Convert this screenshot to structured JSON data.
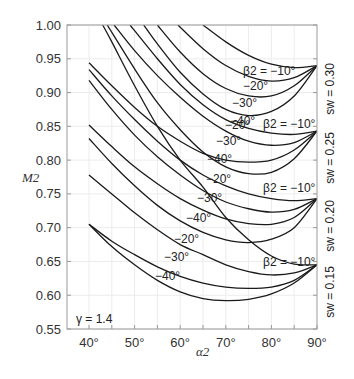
{
  "chart_data": {
    "type": "line",
    "title": "",
    "xlabel": "α2",
    "ylabel": "M2",
    "xlim": [
      35,
      90
    ],
    "ylim": [
      0.55,
      1.0
    ],
    "grid": true,
    "x_ticks": [
      "40°",
      "50°",
      "60°",
      "70°",
      "80°",
      "90°"
    ],
    "x_tick_values": [
      40,
      50,
      60,
      70,
      80,
      90
    ],
    "y_ticks": [
      "1.00",
      "0.95",
      "0.90",
      "0.85",
      "0.80",
      "0.75",
      "0.70",
      "0.65",
      "0.60",
      "0.55"
    ],
    "y_tick_values": [
      1.0,
      0.95,
      0.9,
      0.85,
      0.8,
      0.75,
      0.7,
      0.65,
      0.6,
      0.55
    ],
    "annotation_gamma": "γ = 1.4",
    "families": [
      {
        "name": "s_w = 0.30",
        "label": "sw = 0.30",
        "converge": [
          90,
          0.94
        ],
        "series": [
          {
            "name": "β2 = −10°",
            "points": [
              [
                65,
                1.0
              ],
              [
                70,
                0.975
              ],
              [
                75,
                0.955
              ],
              [
                80,
                0.942
              ],
              [
                85,
                0.937
              ],
              [
                90,
                0.94
              ]
            ]
          },
          {
            "name": "−20°",
            "points": [
              [
                59.5,
                1.0
              ],
              [
                65,
                0.965
              ],
              [
                70,
                0.94
              ],
              [
                75,
                0.924
              ],
              [
                80,
                0.917
              ],
              [
                85,
                0.922
              ],
              [
                90,
                0.94
              ]
            ]
          },
          {
            "name": "−30°",
            "points": [
              [
                55,
                1.0
              ],
              [
                60,
                0.96
              ],
              [
                65,
                0.928
              ],
              [
                70,
                0.906
              ],
              [
                75,
                0.895
              ],
              [
                80,
                0.895
              ],
              [
                85,
                0.91
              ],
              [
                90,
                0.94
              ]
            ]
          },
          {
            "name": "−40°",
            "points": [
              [
                52,
                1.0
              ],
              [
                55,
                0.972
              ],
              [
                60,
                0.93
              ],
              [
                65,
                0.898
              ],
              [
                70,
                0.875
              ],
              [
                75,
                0.866
              ],
              [
                80,
                0.872
              ],
              [
                85,
                0.895
              ],
              [
                90,
                0.94
              ]
            ]
          }
        ]
      },
      {
        "name": "s_w = 0.25",
        "label": "sw = 0.25",
        "converge": [
          90,
          0.843
        ],
        "series": [
          {
            "name": "β2 = −10°",
            "points": [
              [
                49,
                1.0
              ],
              [
                55,
                0.95
              ],
              [
                60,
                0.912
              ],
              [
                65,
                0.882
              ],
              [
                70,
                0.86
              ],
              [
                75,
                0.847
              ],
              [
                80,
                0.84
              ],
              [
                85,
                0.838
              ],
              [
                90,
                0.843
              ]
            ]
          },
          {
            "name": "−20°",
            "points": [
              [
                45.5,
                1.0
              ],
              [
                50,
                0.962
              ],
              [
                55,
                0.925
              ],
              [
                60,
                0.893
              ],
              [
                65,
                0.865
              ],
              [
                70,
                0.843
              ],
              [
                75,
                0.828
              ],
              [
                80,
                0.822
              ],
              [
                85,
                0.826
              ],
              [
                90,
                0.843
              ]
            ]
          },
          {
            "name": "−30°",
            "points": [
              [
                40,
                0.944
              ],
              [
                45,
                0.91
              ],
              [
                50,
                0.878
              ],
              [
                55,
                0.85
              ],
              [
                60,
                0.828
              ],
              [
                65,
                0.81
              ],
              [
                70,
                0.8
              ],
              [
                75,
                0.797
              ],
              [
                80,
                0.8
              ],
              [
                85,
                0.815
              ],
              [
                90,
                0.843
              ]
            ]
          },
          {
            "name": "−40°",
            "points": [
              [
                44,
                1.0
              ],
              [
                50,
                0.935
              ],
              [
                55,
                0.885
              ],
              [
                60,
                0.845
              ],
              [
                65,
                0.812
              ],
              [
                70,
                0.79
              ],
              [
                75,
                0.78
              ],
              [
                80,
                0.782
              ],
              [
                85,
                0.802
              ],
              [
                90,
                0.843
              ]
            ]
          }
        ]
      },
      {
        "name": "s_w = 0.20",
        "label": "sw = 0.20",
        "converge": [
          90,
          0.743
        ],
        "series": [
          {
            "name": "β2 = −10°",
            "points": [
              [
                40,
                0.934
              ],
              [
                45,
                0.895
              ],
              [
                50,
                0.86
              ],
              [
                55,
                0.828
              ],
              [
                60,
                0.8
              ],
              [
                65,
                0.778
              ],
              [
                70,
                0.762
              ],
              [
                75,
                0.75
              ],
              [
                80,
                0.743
              ],
              [
                85,
                0.74
              ],
              [
                90,
                0.743
              ]
            ]
          },
          {
            "name": "−20°",
            "points": [
              [
                40,
                0.918
              ],
              [
                45,
                0.875
              ],
              [
                50,
                0.837
              ],
              [
                55,
                0.805
              ],
              [
                60,
                0.778
              ],
              [
                65,
                0.755
              ],
              [
                70,
                0.738
              ],
              [
                75,
                0.728
              ],
              [
                80,
                0.723
              ],
              [
                85,
                0.727
              ],
              [
                90,
                0.743
              ]
            ]
          },
          {
            "name": "−30°",
            "points": [
              [
                40,
                0.852
              ],
              [
                45,
                0.82
              ],
              [
                50,
                0.79
              ],
              [
                55,
                0.765
              ],
              [
                60,
                0.743
              ],
              [
                65,
                0.726
              ],
              [
                70,
                0.713
              ],
              [
                75,
                0.706
              ],
              [
                80,
                0.705
              ],
              [
                85,
                0.715
              ],
              [
                90,
                0.743
              ]
            ]
          },
          {
            "name": "−40°",
            "points": [
              [
                40,
                0.832
              ],
              [
                45,
                0.795
              ],
              [
                50,
                0.762
              ],
              [
                55,
                0.733
              ],
              [
                60,
                0.71
              ],
              [
                65,
                0.693
              ],
              [
                70,
                0.682
              ],
              [
                75,
                0.678
              ],
              [
                80,
                0.683
              ],
              [
                85,
                0.7
              ],
              [
                90,
                0.743
              ]
            ]
          }
        ]
      },
      {
        "name": "s_w = 0.15",
        "label": "sw = 0.15",
        "converge": [
          90,
          0.645
        ],
        "series": [
          {
            "name": "β2 = −10°",
            "points": [
              [
                43,
                1.0
              ],
              [
                45,
                0.975
              ],
              [
                50,
                0.91
              ],
              [
                55,
                0.85
              ],
              [
                60,
                0.8
              ],
              [
                65,
                0.76
              ],
              [
                70,
                0.715
              ],
              [
                75,
                0.682
              ],
              [
                80,
                0.658
              ],
              [
                85,
                0.646
              ],
              [
                90,
                0.645
              ]
            ]
          },
          {
            "name": "−20°",
            "points": [
              [
                40,
                0.778
              ],
              [
                45,
                0.75
              ],
              [
                50,
                0.722
              ],
              [
                55,
                0.697
              ],
              [
                60,
                0.675
              ],
              [
                65,
                0.66
              ],
              [
                70,
                0.645
              ],
              [
                75,
                0.635
              ],
              [
                80,
                0.63
              ],
              [
                85,
                0.633
              ],
              [
                90,
                0.645
              ]
            ]
          },
          {
            "name": "−30°",
            "points": [
              [
                40,
                0.705
              ],
              [
                45,
                0.68
              ],
              [
                50,
                0.66
              ],
              [
                55,
                0.642
              ],
              [
                60,
                0.628
              ],
              [
                65,
                0.618
              ],
              [
                70,
                0.612
              ],
              [
                75,
                0.61
              ],
              [
                80,
                0.612
              ],
              [
                85,
                0.622
              ],
              [
                90,
                0.645
              ]
            ]
          },
          {
            "name": "−40°",
            "points": [
              [
                40,
                0.705
              ],
              [
                45,
                0.672
              ],
              [
                50,
                0.645
              ],
              [
                55,
                0.622
              ],
              [
                60,
                0.605
              ],
              [
                65,
                0.595
              ],
              [
                70,
                0.592
              ],
              [
                75,
                0.594
              ],
              [
                80,
                0.602
              ],
              [
                85,
                0.618
              ],
              [
                90,
                0.645
              ]
            ]
          }
        ]
      }
    ],
    "curve_labels": [
      {
        "text": "β2 = −10°",
        "x": 243,
        "y": 75
      },
      {
        "text": "−20°",
        "x": 243,
        "y": 90
      },
      {
        "text": "−30°",
        "x": 232,
        "y": 107
      },
      {
        "text": "−40°",
        "x": 230,
        "y": 125
      },
      {
        "text": "β2 = −10°",
        "x": 263,
        "y": 128
      },
      {
        "text": "−20°",
        "x": 225,
        "y": 129
      },
      {
        "text": "−30°",
        "x": 216,
        "y": 145
      },
      {
        "text": "−40°",
        "x": 207,
        "y": 163
      },
      {
        "text": "β2 = −10°",
        "x": 263,
        "y": 192
      },
      {
        "text": "−20°",
        "x": 206,
        "y": 183
      },
      {
        "text": "−30°",
        "x": 197,
        "y": 202
      },
      {
        "text": "−40°",
        "x": 186,
        "y": 222
      },
      {
        "text": "β2 = −10°",
        "x": 263,
        "y": 266
      },
      {
        "text": "−20°",
        "x": 174,
        "y": 243
      },
      {
        "text": "−30°",
        "x": 164,
        "y": 261
      },
      {
        "text": "−40°",
        "x": 155,
        "y": 280
      }
    ],
    "right_labels": [
      {
        "text": "sw = 0.30",
        "y": 59
      },
      {
        "text": "sw = 0.25",
        "y": 128
      },
      {
        "text": "sw = 0.20",
        "y": 196
      },
      {
        "text": "sw = 0.15",
        "y": 262
      }
    ]
  }
}
